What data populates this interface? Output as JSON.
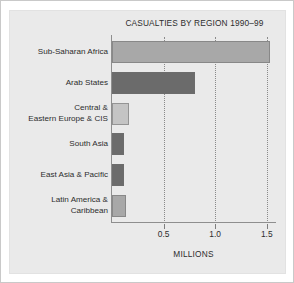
{
  "chart_data": {
    "type": "bar",
    "orientation": "horizontal",
    "title": "CASUALTIES BY REGION 1990–99",
    "xlabel": "MILLIONS",
    "ylabel": "",
    "categories": [
      "Sub-Saharan Africa",
      "Arab States",
      "Central &\nEastern Europe & CIS",
      "South Asia",
      "East Asia & Pacific",
      "Latin America &\nCaribbean"
    ],
    "values": [
      1.53,
      0.8,
      0.16,
      0.12,
      0.12,
      0.14
    ],
    "bar_colors": [
      "#a8a8a8",
      "#6b6b6b",
      "#c4c4c4",
      "#6b6b6b",
      "#6b6b6b",
      "#a8a8a8"
    ],
    "xlim": [
      0,
      1.58
    ],
    "ylim": null,
    "xticks": [
      0.5,
      1.0,
      1.5
    ],
    "xtick_labels": [
      "0.5",
      "1.0",
      "1.5"
    ],
    "grid": "vertical-dotted",
    "legend": null,
    "background_color": "#eaeaea",
    "axis_color": "#8e8e8e",
    "text_color": "#2d2d2d"
  },
  "categories_display": [
    {
      "line1": "Sub-Saharan Africa",
      "line2": ""
    },
    {
      "line1": "Arab States",
      "line2": ""
    },
    {
      "line1": "Central &",
      "line2": "Eastern Europe & CIS"
    },
    {
      "line1": "South Asia",
      "line2": ""
    },
    {
      "line1": "East Asia & Pacific",
      "line2": ""
    },
    {
      "line1": "Latin America &",
      "line2": "Caribbean"
    }
  ]
}
